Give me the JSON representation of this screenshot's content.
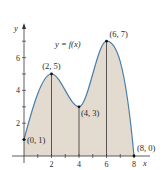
{
  "chart_data": {
    "type": "area",
    "title": "",
    "function_label": "y = f(x)",
    "xlabel": "x",
    "ylabel": "y",
    "xlim": [
      0,
      8.5
    ],
    "ylim": [
      0,
      7.8
    ],
    "x_ticks": [
      2,
      4,
      6,
      8
    ],
    "x_minor_ticks": [
      1,
      3,
      5,
      7
    ],
    "y_ticks": [
      2,
      4,
      6
    ],
    "y_minor_ticks": [
      1,
      3,
      5,
      7
    ],
    "grid": false,
    "key_points": [
      {
        "x": 0,
        "y": 1,
        "label": "(0, 1)"
      },
      {
        "x": 2,
        "y": 5,
        "label": "(2, 5)"
      },
      {
        "x": 4,
        "y": 3,
        "label": "(4, 3)"
      },
      {
        "x": 6,
        "y": 7,
        "label": "(6, 7)"
      },
      {
        "x": 8,
        "y": 0,
        "label": "(8, 0)"
      }
    ],
    "vertical_lines_at": [
      2,
      4,
      6
    ],
    "curve_color": "#4a7fa8",
    "fill_color": "#e3dbd0"
  }
}
